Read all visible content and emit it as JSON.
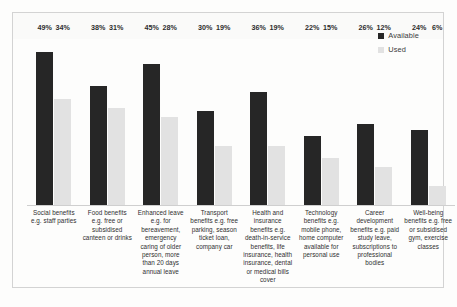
{
  "chart_data": {
    "type": "bar",
    "title": "",
    "subtitle": "",
    "xlabel": "",
    "ylabel": "",
    "ylim": [
      0,
      55
    ],
    "grid": false,
    "legend_position": "top-right",
    "value_suffix": "%",
    "categories": [
      "Social benefits e.g. staff parties",
      "Food benefits e.g. free or subsidised canteen or drinks",
      "Enhanced leave e.g. for bereavement, emergency caring of older person, more than 20 days annual leave",
      "Transport benefits e.g. free parking, season ticket loan, company car",
      "Health and insurance benefits e.g. death-in-service benefits, life insurance, health insurance, dental or medical bills cover",
      "Technology benefits e.g. mobile phone, home computer available for personal use",
      "Career development benefits e.g. paid study leave, subscriptions to professional bodies",
      "Well-being benefits e.g. free or subsidised gym, exercise classes"
    ],
    "series": [
      {
        "name": "Available",
        "color": "#262626",
        "values": [
          49,
          38,
          45,
          30,
          36,
          22,
          26,
          24
        ],
        "labels": [
          "49%",
          "38%",
          "45%",
          "30%",
          "36%",
          "22%",
          "26%",
          "24%"
        ]
      },
      {
        "name": "Used",
        "color": "#e2e2e2",
        "values": [
          34,
          31,
          28,
          19,
          19,
          15,
          12,
          6
        ],
        "labels": [
          "34%",
          "31%",
          "28%",
          "19%",
          "19%",
          "15%",
          "12%",
          "6%"
        ]
      }
    ]
  },
  "legend": {
    "items": [
      {
        "label": "Available"
      },
      {
        "label": "Used"
      }
    ]
  }
}
